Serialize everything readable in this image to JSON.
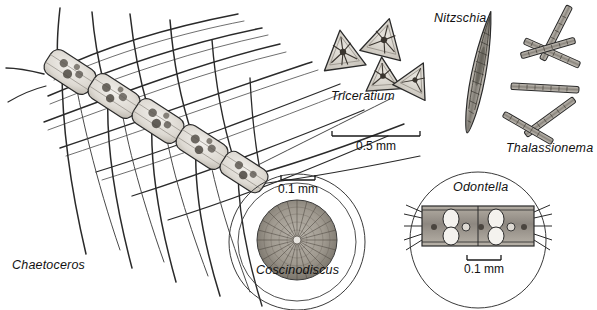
{
  "plate": {
    "title": "Marine diatom plate",
    "background_color": "#ffffff",
    "ink_color": "#1a1a1a",
    "width": 597,
    "height": 310
  },
  "specimens": [
    {
      "id": "chaetoceros",
      "label": "Chaetoceros",
      "form": "chain of box-shaped cells with long curved setae",
      "cell_count": 6
    },
    {
      "id": "triceratium",
      "label": "Triceratium",
      "form": "triangular valves with radial central star",
      "cell_count": 4
    },
    {
      "id": "nitzschia",
      "label": "Nitzschia",
      "form": "elongate pointed spindle, tilted",
      "cell_count": 1
    },
    {
      "id": "thalassionema",
      "label": "Thalassionema",
      "form": "zigzag chain of narrow rod cells",
      "cell_count": 6
    },
    {
      "id": "coscinodiscus",
      "label": "Coscinodiscus",
      "form": "circular valve with radial areolae, shown in round magnifier frame",
      "cell_count": 1
    },
    {
      "id": "odontella",
      "label": "Odontella",
      "form": "girdle band of cells with ocelli and bristles, shown in round magnifier frame",
      "cell_count": 2
    }
  ],
  "scale_bars": [
    {
      "id": "scale-main",
      "value": "0.5 mm",
      "applies_to": "Triceratium, Nitzschia, Thalassionema, Chaetoceros"
    },
    {
      "id": "scale-coscinodiscus",
      "value": "0.1 mm",
      "applies_to": "Coscinodiscus"
    },
    {
      "id": "scale-odontella",
      "value": "0.1 mm",
      "applies_to": "Odontella"
    }
  ]
}
